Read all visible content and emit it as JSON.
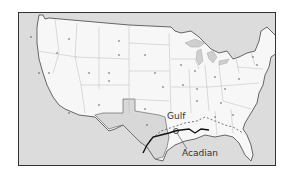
{
  "map": {
    "title": "United States pipeline map",
    "labels": {
      "gulf": "Gulf",
      "acadian": "Acadian"
    },
    "colors": {
      "land": "#f7f7f7",
      "water": "#dcdcdc",
      "highlight_state": "#d8d8d8",
      "border": "#333333",
      "state_lines": "#bbbbbb",
      "pipeline": "#111111"
    },
    "highlighted_region": "Texas",
    "features": [
      "state-boundaries",
      "state-capital-dots",
      "great-lakes",
      "gulf-coast-pipeline"
    ]
  }
}
